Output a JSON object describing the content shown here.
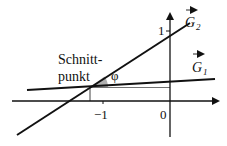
{
  "figure": {
    "type": "line-intersection-diagram",
    "colors": {
      "line": "#111111",
      "angle_fill": "#b0b0b0",
      "background": "#ffffff"
    },
    "labels": {
      "intersection": [
        "Schnitt-",
        "punkt"
      ],
      "angle": "φ",
      "line_g2": "G",
      "line_g2_sub": "2",
      "line_g1": "G",
      "line_g1_sub": "1",
      "tick_y_one": "1",
      "tick_x_minus_one": "−1",
      "tick_origin": "0"
    }
  }
}
